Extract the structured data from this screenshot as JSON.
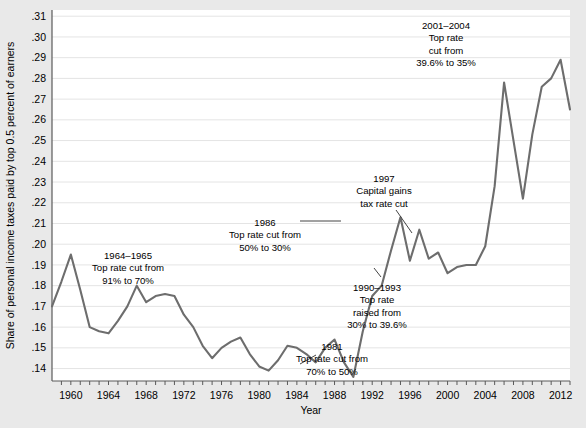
{
  "figure": {
    "background_color": "#e9e9e9",
    "plot_background_color": "#ffffff",
    "line_color": "#6d6d6d",
    "grid_color": "#e4e4e4",
    "axis_color": "#5a5a5a",
    "text_color": "#000000"
  },
  "chart_data": {
    "type": "line",
    "title": "",
    "subtitle": "",
    "xlabel": "Year",
    "ylabel": "Share of personal income taxes paid by top 0.5 percent of earners",
    "xlim": [
      1958,
      2013
    ],
    "ylim": [
      0.134,
      0.313
    ],
    "grid": true,
    "legend": false,
    "legend_position": "none",
    "ytick_labels": [
      ".14",
      ".15",
      ".16",
      ".17",
      ".18",
      ".19",
      ".20",
      ".21",
      ".22",
      ".23",
      ".24",
      ".25",
      ".26",
      ".27",
      ".28",
      ".29",
      ".30",
      ".31"
    ],
    "ytick_values": [
      0.14,
      0.15,
      0.16,
      0.17,
      0.18,
      0.19,
      0.2,
      0.21,
      0.22,
      0.23,
      0.24,
      0.25,
      0.26,
      0.27,
      0.28,
      0.29,
      0.3,
      0.31
    ],
    "xtick_labels": [
      "1960",
      "1964",
      "1968",
      "1972",
      "1976",
      "1980",
      "1984",
      "1988",
      "1992",
      "1996",
      "2000",
      "2004",
      "2008",
      "2012"
    ],
    "xtick_values": [
      1960,
      1964,
      1968,
      1972,
      1976,
      1980,
      1984,
      1988,
      1992,
      1996,
      2000,
      2004,
      2008,
      2012
    ],
    "xtick_minor_values": [
      1959,
      1960,
      1961,
      1962,
      1963,
      1964,
      1965,
      1966,
      1967,
      1968,
      1969,
      1970,
      1971,
      1972,
      1973,
      1974,
      1975,
      1976,
      1977,
      1978,
      1979,
      1980,
      1981,
      1982,
      1983,
      1984,
      1985,
      1986,
      1987,
      1988,
      1989,
      1990,
      1991,
      1992,
      1993,
      1994,
      1995,
      1996,
      1997,
      1998,
      1999,
      2000,
      2001,
      2002,
      2003,
      2004,
      2005,
      2006,
      2007,
      2008,
      2009,
      2010,
      2011,
      2012,
      2013
    ],
    "x": [
      1958,
      1959,
      1960,
      1961,
      1962,
      1963,
      1964,
      1965,
      1966,
      1967,
      1968,
      1969,
      1970,
      1971,
      1972,
      1973,
      1974,
      1975,
      1976,
      1977,
      1978,
      1979,
      1980,
      1981,
      1982,
      1983,
      1984,
      1985,
      1986,
      1987,
      1988,
      1989,
      1990,
      1991,
      1992,
      1993,
      1994,
      1995,
      1996,
      1997,
      1998,
      1999,
      2000,
      2001,
      2002,
      2003,
      2004,
      2005,
      2006,
      2007,
      2008,
      2009,
      2010,
      2011,
      2012,
      2013
    ],
    "y": [
      0.17,
      0.182,
      0.195,
      0.178,
      0.16,
      0.158,
      0.157,
      0.163,
      0.168,
      0.172,
      0.18,
      0.172,
      0.168,
      0.175,
      0.176,
      0.175,
      0.168,
      0.162,
      0.154,
      0.145,
      0.15,
      0.153,
      0.155,
      0.148,
      0.143,
      0.14,
      0.144,
      0.15,
      0.151,
      0.148,
      0.143,
      0.15,
      0.154,
      0.147,
      0.138,
      0.136,
      0.15,
      0.168,
      0.18,
      0.196,
      0.212,
      0.198,
      0.213,
      0.192,
      0.193,
      0.191,
      0.189,
      0.19,
      0.199,
      0.225,
      0.278,
      0.25,
      0.268,
      0.276,
      0.273,
      0.289,
      0.275,
      0.223,
      0.244,
      0.232,
      0.268,
      0.275,
      0.265
    ],
    "series": [
      {
        "name": "Share of personal income taxes paid by top 0.5 percent of earners",
        "points": [
          {
            "year": 1958,
            "value": 0.17
          },
          {
            "year": 1959,
            "value": 0.182
          },
          {
            "year": 1960,
            "value": 0.195
          },
          {
            "year": 1961,
            "value": 0.178
          },
          {
            "year": 1962,
            "value": 0.16
          },
          {
            "year": 1963,
            "value": 0.158
          },
          {
            "year": 1964,
            "value": 0.157
          },
          {
            "year": 1965,
            "value": 0.163
          },
          {
            "year": 1966,
            "value": 0.17
          },
          {
            "year": 1967,
            "value": 0.18
          },
          {
            "year": 1968,
            "value": 0.172
          },
          {
            "year": 1969,
            "value": 0.175
          },
          {
            "year": 1970,
            "value": 0.176
          },
          {
            "year": 1971,
            "value": 0.175
          },
          {
            "year": 1972,
            "value": 0.166
          },
          {
            "year": 1973,
            "value": 0.16
          },
          {
            "year": 1974,
            "value": 0.151
          },
          {
            "year": 1975,
            "value": 0.145
          },
          {
            "year": 1976,
            "value": 0.15
          },
          {
            "year": 1977,
            "value": 0.153
          },
          {
            "year": 1978,
            "value": 0.155
          },
          {
            "year": 1979,
            "value": 0.147
          },
          {
            "year": 1980,
            "value": 0.141
          },
          {
            "year": 1981,
            "value": 0.139
          },
          {
            "year": 1982,
            "value": 0.144
          },
          {
            "year": 1983,
            "value": 0.151
          },
          {
            "year": 1984,
            "value": 0.15
          },
          {
            "year": 1985,
            "value": 0.147
          },
          {
            "year": 1986,
            "value": 0.143
          },
          {
            "year": 1987,
            "value": 0.15
          },
          {
            "year": 1988,
            "value": 0.154
          },
          {
            "year": 1989,
            "value": 0.143
          },
          {
            "year": 1990,
            "value": 0.136
          },
          {
            "year": 1991,
            "value": 0.158
          },
          {
            "year": 1992,
            "value": 0.175
          },
          {
            "year": 1993,
            "value": 0.18
          },
          {
            "year": 1994,
            "value": 0.197
          },
          {
            "year": 1995,
            "value": 0.213
          },
          {
            "year": 1996,
            "value": 0.192
          },
          {
            "year": 1997,
            "value": 0.207
          },
          {
            "year": 1998,
            "value": 0.193
          },
          {
            "year": 1999,
            "value": 0.196
          },
          {
            "year": 2000,
            "value": 0.186
          },
          {
            "year": 2001,
            "value": 0.189
          },
          {
            "year": 2002,
            "value": 0.19
          },
          {
            "year": 2003,
            "value": 0.19
          },
          {
            "year": 2004,
            "value": 0.199
          },
          {
            "year": 2005,
            "value": 0.228
          },
          {
            "year": 2006,
            "value": 0.278
          },
          {
            "year": 2007,
            "value": 0.25
          },
          {
            "year": 2008,
            "value": 0.222
          },
          {
            "year": 2009,
            "value": 0.253
          },
          {
            "year": 2010,
            "value": 0.276
          },
          {
            "year": 2011,
            "value": 0.28
          },
          {
            "year": 2012,
            "value": 0.289
          },
          {
            "year": 2013,
            "value": 0.265
          }
        ]
      }
    ],
    "annotations": [
      {
        "id": "ann-1964",
        "lines": [
          "1964–1965",
          "Top rate cut from",
          "91% to 70%"
        ],
        "x_px": 128,
        "y_px": 259,
        "anchor": "middle"
      },
      {
        "id": "ann-1986",
        "lines": [
          "1986",
          "Top rate cut from",
          "50% to 30%"
        ],
        "x_px": 265,
        "y_px": 226,
        "anchor": "middle"
      },
      {
        "id": "ann-1981",
        "lines": [
          "1981",
          "Top rate cut from",
          "70% to 50%"
        ],
        "x_px": 332,
        "y_px": 350,
        "anchor": "middle"
      },
      {
        "id": "ann-1990",
        "lines": [
          "1990–1993",
          "Top rate",
          "raised from",
          "30% to 39.6%"
        ],
        "x_px": 377,
        "y_px": 291,
        "anchor": "middle"
      },
      {
        "id": "ann-1997",
        "lines": [
          "1997",
          "Capital gains",
          "tax rate cut"
        ],
        "x_px": 384,
        "y_px": 182,
        "anchor": "middle"
      },
      {
        "id": "ann-2001",
        "lines": [
          "2001–2004",
          "Top rate",
          "cut from",
          "39.6% to 35%"
        ],
        "x_px": 446,
        "y_px": 29,
        "anchor": "middle"
      }
    ]
  }
}
